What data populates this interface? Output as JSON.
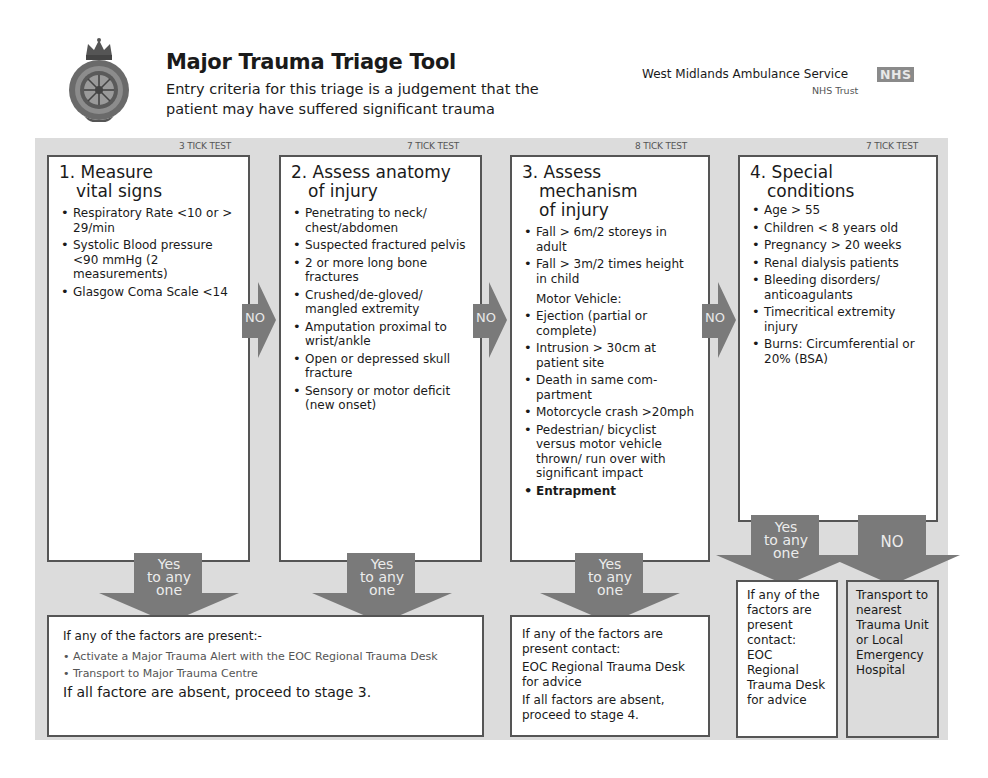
{
  "header": {
    "logo_icon": "ambulance-crest-icon",
    "title": "Major Trauma Triage Tool",
    "subtitle": "Entry criteria for this triage is a judgement that the patient may have suffered significant trauma",
    "organisation": "West Midlands Ambulance Service",
    "nhs_badge": "NHS",
    "trust_label": "NHS Trust"
  },
  "stages": [
    {
      "tick_label": "3 TICK TEST",
      "title_line1": "1. Measure",
      "title_line2": "vital signs",
      "title_line3": "",
      "items": [
        "Respiratory Rate <10 or > 29/min",
        "Systolic Blood pressure <90 mmHg (2 measurements)",
        "Glasgow Coma Scale <14"
      ]
    },
    {
      "tick_label": "7 TICK TEST",
      "title_line1": "2. Assess anatomy",
      "title_line2": "of injury",
      "title_line3": "",
      "items": [
        "Penetrating to neck/ chest/abdomen",
        "Suspected fractured pelvis",
        "2 or more long bone fractures",
        "Crushed/de-gloved/ mangled extremity",
        "Amputation proximal to wrist/ankle",
        "Open or depressed skull fracture",
        "Sensory or motor deficit (new onset)"
      ]
    },
    {
      "tick_label": "8 TICK TEST",
      "title_line1": "3. Assess",
      "title_line2": "mechanism",
      "title_line3": "of injury",
      "items": [
        "Fall > 6m/2 storeys in adult",
        "Fall > 3m/2 times height in child"
      ],
      "subheading": "Motor Vehicle:",
      "items_after": [
        "Ejection (partial or complete)",
        "Intrusion > 30cm at patient site",
        "Death in same com- partment",
        "Motorcycle crash >20mph",
        "Pedestrian/ bicyclist versus motor vehicle thrown/ run over with significant impact",
        "Entrapment"
      ]
    },
    {
      "tick_label": "7 TICK TEST",
      "title_line1": "4. Special",
      "title_line2": "conditions",
      "title_line3": "",
      "items": [
        "Age > 55",
        "Children < 8 years old",
        "Pregnancy > 20 weeks",
        "Renal dialysis patients",
        "Bleeding disorders/ anticoagulants",
        "Timecritical extremity injury",
        "Burns: Circumferential or 20% (BSA)"
      ]
    }
  ],
  "arrows": {
    "no_label": "NO",
    "yes_line1": "Yes",
    "yes_line2": "to any",
    "yes_line3": "one",
    "color": "#7a7a7a"
  },
  "outcomes": {
    "stages_1_2": {
      "intro": "If any of the factors are present:-",
      "actions": [
        "Activate a Major Trauma Alert with the EOC Regional Trauma Desk",
        "Transport to Major Trauma Centre"
      ],
      "absent": "If all factore are absent, proceed to stage 3."
    },
    "stage_3": {
      "intro": "If any of the factors are present contact:",
      "contact": "EOC Regional Trauma Desk for advice",
      "absent": "If all factors are absent, proceed to stage 4."
    },
    "stage_4_yes": {
      "intro": "If any of the factors are present contact:",
      "contact": "EOC Regional Trauma Desk for advice"
    },
    "stage_4_no": {
      "text": "Transport to nearest Trauma Unit or Local Emergency Hospital"
    }
  },
  "colors": {
    "panel_bg": "#dcdcdc",
    "box_border": "#555555",
    "arrow": "#7a7a7a"
  }
}
